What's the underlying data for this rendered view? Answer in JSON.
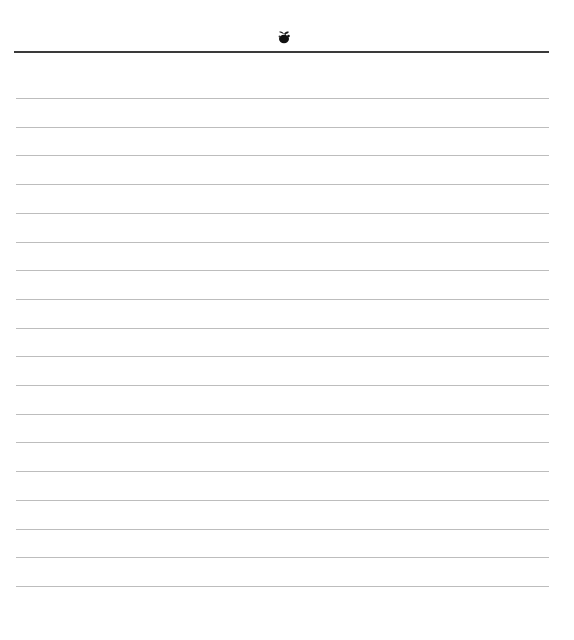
{
  "page": {
    "type": "lined-paper",
    "header": {
      "ornament_icon": "fleuron-ornament-icon",
      "rule_color": "#3a3a3a"
    },
    "lines": {
      "count": 18,
      "first_y": 98,
      "spacing": 28.7,
      "color": "#bdbdbd"
    },
    "background_color": "#ffffff"
  }
}
